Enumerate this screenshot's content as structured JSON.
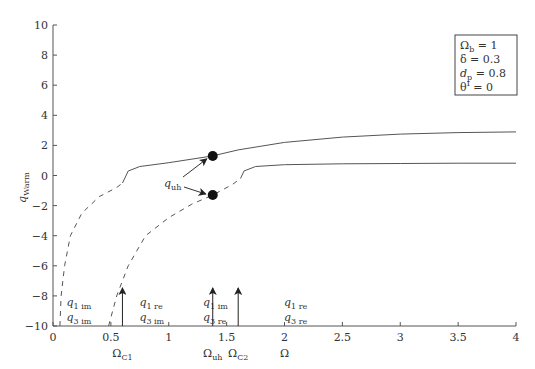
{
  "chart_data": {
    "type": "line",
    "title": "",
    "xlabel": "Ω",
    "ylabel": "q_Warm",
    "xlim": [
      0,
      4
    ],
    "ylim": [
      -10,
      10
    ],
    "grid": false,
    "xticks": [
      "0",
      "0.5",
      "1",
      "1.5",
      "2",
      "2.5",
      "3",
      "3.5",
      "4"
    ],
    "yticks": [
      "10",
      "8",
      "6",
      "4",
      "2",
      "0",
      "-2",
      "-4",
      "-6",
      "-8",
      "-10"
    ],
    "series": [
      {
        "name": "upper branch (dashed, imaginary)",
        "style": "dashed",
        "points": [
          [
            0.06,
            -10
          ],
          [
            0.07,
            -8
          ],
          [
            0.1,
            -6
          ],
          [
            0.15,
            -4
          ],
          [
            0.25,
            -2.5
          ],
          [
            0.4,
            -1.4
          ],
          [
            0.55,
            -0.8
          ],
          [
            0.6,
            -0.5
          ]
        ]
      },
      {
        "name": "upper branch (solid, real)",
        "style": "solid",
        "points": [
          [
            0.6,
            -0.5
          ],
          [
            0.65,
            0.3
          ],
          [
            0.75,
            0.6
          ],
          [
            1.0,
            0.85
          ],
          [
            1.38,
            1.3
          ],
          [
            1.6,
            1.7
          ],
          [
            2.0,
            2.2
          ],
          [
            2.5,
            2.55
          ],
          [
            3.0,
            2.75
          ],
          [
            3.5,
            2.85
          ],
          [
            4.0,
            2.9
          ]
        ]
      },
      {
        "name": "lower branch (dashed, imaginary)",
        "style": "dashed",
        "points": [
          [
            0.48,
            -10
          ],
          [
            0.55,
            -8
          ],
          [
            0.65,
            -6
          ],
          [
            0.8,
            -4
          ],
          [
            1.0,
            -2.8
          ],
          [
            1.2,
            -1.9
          ],
          [
            1.38,
            -1.3
          ],
          [
            1.55,
            -0.6
          ],
          [
            1.62,
            -0.2
          ]
        ]
      },
      {
        "name": "lower branch (solid, real)",
        "style": "solid",
        "points": [
          [
            1.62,
            -0.2
          ],
          [
            1.65,
            0.3
          ],
          [
            1.75,
            0.6
          ],
          [
            2.0,
            0.72
          ],
          [
            2.5,
            0.78
          ],
          [
            3.0,
            0.8
          ],
          [
            3.5,
            0.82
          ],
          [
            4.0,
            0.82
          ]
        ]
      }
    ],
    "markers": [
      {
        "name": "q_uh upper",
        "x": 1.38,
        "y": 1.3
      },
      {
        "name": "q_uh lower",
        "x": 1.38,
        "y": -1.3
      }
    ],
    "annotations": {
      "q_uh_label": "q",
      "q_uh_sub": "uh",
      "regions": [
        {
          "x": 0.22,
          "line1": "q",
          "sub1": "1 im",
          "line2": "q",
          "sub2": "3 im"
        },
        {
          "x": 0.85,
          "line1": "q",
          "sub1": "1 re",
          "line2": "q",
          "sub2": "3 im"
        },
        {
          "x": 1.4,
          "line1": "q",
          "sub1": "1 im",
          "line2": "q",
          "sub2": "3 re"
        },
        {
          "x": 2.1,
          "line1": "q",
          "sub1": "1 re",
          "line2": "q",
          "sub2": "3 re"
        }
      ],
      "arrows": [
        {
          "x": 0.6,
          "label": "Ω",
          "sub": "C1"
        },
        {
          "x": 1.38,
          "label": "Ω",
          "sub": "uh"
        },
        {
          "x": 1.6,
          "label": "Ω",
          "sub": "C2"
        }
      ]
    },
    "legend_box": [
      {
        "sym": "Ω",
        "sub": "b",
        "val": "= 1"
      },
      {
        "sym": "δ",
        "sub": "",
        "val": "= 0.3"
      },
      {
        "sym": "d",
        "sub": "p",
        "val": "= 0.8"
      },
      {
        "sym": "θ",
        "sup": "I",
        "val": "= 0"
      }
    ]
  }
}
